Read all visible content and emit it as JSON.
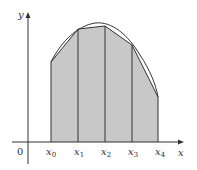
{
  "diagram": {
    "axes": {
      "x_label": "x",
      "y_label": "y",
      "origin_label": "0"
    },
    "partition_points": [
      {
        "base": "x",
        "sub": "0"
      },
      {
        "base": "x",
        "sub": "1"
      },
      {
        "base": "x",
        "sub": "2"
      },
      {
        "base": "x",
        "sub": "3"
      },
      {
        "base": "x",
        "sub": "4"
      }
    ],
    "colors": {
      "fill": "#c8c8c8",
      "stroke": "#333333",
      "background": "#ffffff"
    }
  }
}
